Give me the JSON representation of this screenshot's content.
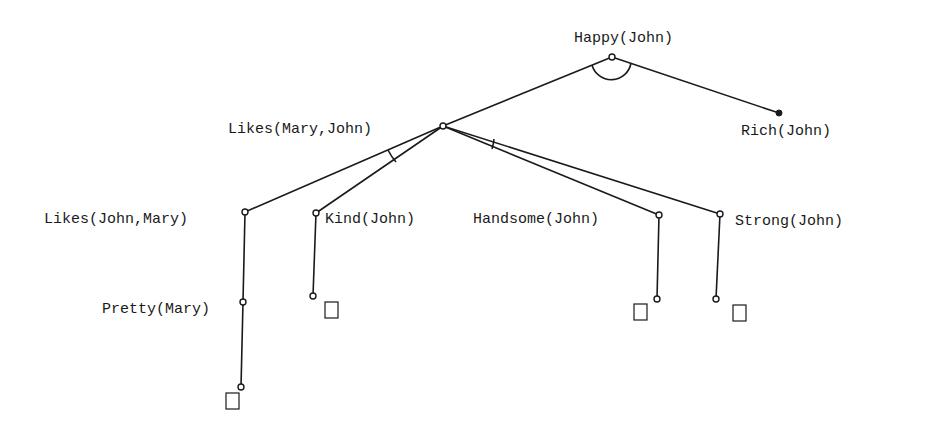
{
  "diagram": {
    "type": "and-or-tree",
    "nodes": [
      {
        "id": "happy",
        "label": "Happy(John)",
        "x": 612,
        "y": 57,
        "label_x": 574,
        "label_y": 42
      },
      {
        "id": "rich",
        "label": "Rich(John)",
        "x": 779,
        "y": 113,
        "label_x": 741,
        "label_y": 135,
        "terminal": true
      },
      {
        "id": "likes_mj",
        "label": "Likes(Mary,John)",
        "x": 443,
        "y": 126,
        "label_x": 228,
        "label_y": 133
      },
      {
        "id": "likes_jm",
        "label": "Likes(John,Mary)",
        "x": 245,
        "y": 212,
        "label_x": 44,
        "label_y": 223
      },
      {
        "id": "kind",
        "label": "Kind(John)",
        "x": 316,
        "y": 213,
        "label_x": 325,
        "label_y": 223
      },
      {
        "id": "handsome",
        "label": "Handsome(John)",
        "x": 659,
        "y": 215,
        "label_x": 473,
        "label_y": 223
      },
      {
        "id": "strong",
        "label": "Strong(John)",
        "x": 720,
        "y": 214,
        "label_x": 735,
        "label_y": 225
      },
      {
        "id": "pretty",
        "label": "Pretty(Mary)",
        "x": 243,
        "y": 302,
        "label_x": 102,
        "label_y": 313
      }
    ],
    "edges": [
      {
        "from": "happy",
        "to": "likes_mj"
      },
      {
        "from": "happy",
        "to": "rich"
      },
      {
        "from": "likes_mj",
        "to": "likes_jm"
      },
      {
        "from": "likes_mj",
        "to": "kind"
      },
      {
        "from": "likes_mj",
        "to": "handsome"
      },
      {
        "from": "likes_mj",
        "to": "strong"
      },
      {
        "from": "likes_jm",
        "to": "pretty"
      }
    ],
    "and_arcs": [
      {
        "at": "happy",
        "children": [
          "likes_mj",
          "rich"
        ]
      },
      {
        "at": "likes_mj",
        "children": [
          "likes_jm",
          "kind"
        ]
      },
      {
        "at": "likes_mj",
        "children": [
          "handsome",
          "strong"
        ]
      }
    ],
    "leaf_stubs": [
      {
        "from": "kind",
        "end_x": 313,
        "end_y": 296,
        "box_x": 325,
        "box_y": 302
      },
      {
        "from": "handsome",
        "end_x": 657,
        "end_y": 299,
        "box_x": 634,
        "box_y": 304
      },
      {
        "from": "strong",
        "end_x": 716,
        "end_y": 299,
        "box_x": 733,
        "box_y": 305
      },
      {
        "from": "pretty",
        "end_x": 241,
        "end_y": 387,
        "box_x": 226,
        "box_y": 393
      }
    ]
  }
}
